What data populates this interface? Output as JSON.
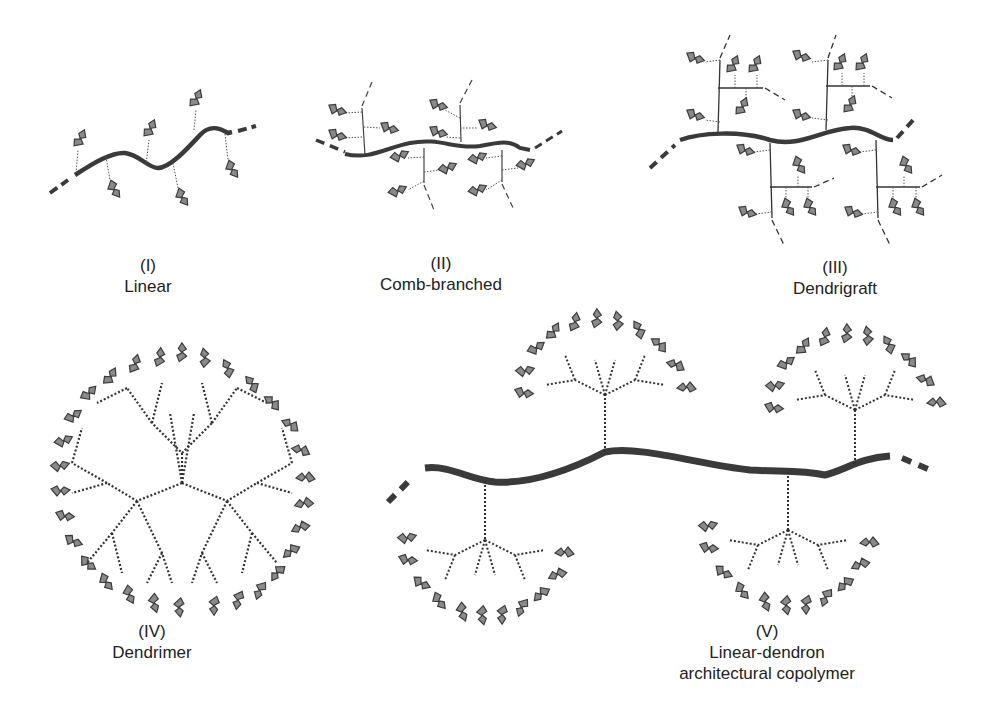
{
  "panels": [
    {
      "id": "I",
      "numeral": "(I)",
      "name": "Linear",
      "label_x": 148,
      "label_y": 255
    },
    {
      "id": "II",
      "numeral": "(II)",
      "name": "Comb-branched",
      "label_x": 441,
      "label_y": 253
    },
    {
      "id": "III",
      "numeral": "(III)",
      "name": "Dendrigraft",
      "label_x": 835,
      "label_y": 257
    },
    {
      "id": "IV",
      "numeral": "(IV)",
      "name": "Dendrimer",
      "label_x": 152,
      "label_y": 620
    },
    {
      "id": "V",
      "numeral": "(V)",
      "name": "Linear-dendron",
      "name2": "architectural copolymer",
      "label_x": 767,
      "label_y": 620
    }
  ],
  "colors": {
    "backbone": "#3a3a3a",
    "branch": "#444444",
    "end_group_fill": "#8a8a8a",
    "end_group_stroke": "#3c3c3c",
    "text": "#222222"
  }
}
